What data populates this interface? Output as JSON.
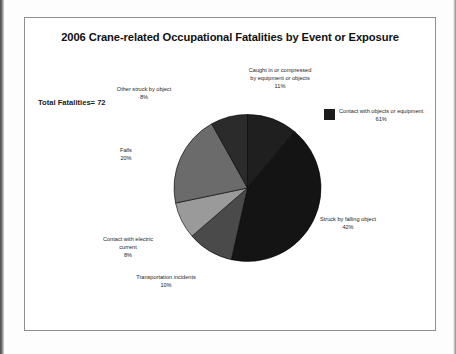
{
  "document": {
    "frame_label": "chart-frame"
  },
  "chart_data": {
    "type": "pie",
    "title": "2006 Crane-related Occupational Fatalities by Event or Exposure",
    "total_label": "Total Fatalities= 72",
    "total_value": 72,
    "units": "percent",
    "start_angle_deg": 0,
    "direction": "clockwise",
    "legend": {
      "position": "right",
      "entries": [
        {
          "label": "Contact with objects or equipment",
          "percent_label": "61%",
          "value": 61,
          "color": "#1c1c1c"
        }
      ]
    },
    "categories": [
      "Caught in or compressed by equipment or objects",
      "Struck by falling object",
      "Transportation incidents",
      "Contact with electric current",
      "Falls",
      "Other struck by object"
    ],
    "values": [
      11,
      42,
      10,
      8,
      20,
      8
    ],
    "slices": [
      {
        "name": "caught-in-or-compressed",
        "label_line1": "Caught in or compressed",
        "label_line2": "by equipment or objects",
        "percent_label": "11%",
        "value": 11,
        "color": "#1f1f1f"
      },
      {
        "name": "struck-by-falling-object",
        "label_line1": "Struck by falling object",
        "label_line2": "",
        "percent_label": "42%",
        "value": 42,
        "color": "#141414"
      },
      {
        "name": "transportation-incidents",
        "label_line1": "Transportation incidents",
        "label_line2": "",
        "percent_label": "10%",
        "value": 10,
        "color": "#4a4a4a"
      },
      {
        "name": "contact-with-electric-current",
        "label_line1": "Contact with electric",
        "label_line2": "current",
        "percent_label": "8%",
        "value": 8,
        "color": "#9a9a9a"
      },
      {
        "name": "falls",
        "label_line1": "Falls",
        "label_line2": "",
        "percent_label": "20%",
        "value": 20,
        "color": "#6b6b6b"
      },
      {
        "name": "other-struck-by-object",
        "label_line1": "Other struck by object",
        "label_line2": "",
        "percent_label": "8%",
        "value": 8,
        "color": "#2b2b2b"
      }
    ]
  }
}
